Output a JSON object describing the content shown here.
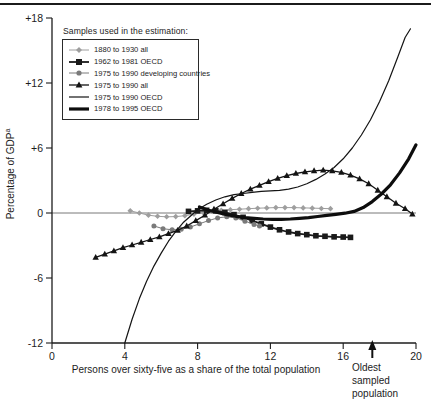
{
  "figure": {
    "background": "#ffffff",
    "rule_color": "#1b1b1b"
  },
  "chart_data": {
    "type": "line",
    "xlabel": "Persons over sixty-five as a share of the total population",
    "ylabel": "Percentage of GDP",
    "ylabel_superscript": "a",
    "xlim": [
      0,
      20
    ],
    "ylim": [
      -12,
      18
    ],
    "grid": false,
    "zero_line": true,
    "x_ticks": [
      {
        "value": 0,
        "label": "0"
      },
      {
        "value": 4,
        "label": "4"
      },
      {
        "value": 8,
        "label": "8"
      },
      {
        "value": 12,
        "label": "12"
      },
      {
        "value": 16,
        "label": "16"
      },
      {
        "value": 20,
        "label": "20"
      }
    ],
    "y_ticks": [
      {
        "value": 18,
        "label": "+18"
      },
      {
        "value": 12,
        "label": "+12"
      },
      {
        "value": 6,
        "label": "+6"
      },
      {
        "value": 0,
        "label": "0"
      },
      {
        "value": -6,
        "label": "-6"
      },
      {
        "value": -12,
        "label": "-12"
      }
    ],
    "legend": {
      "title": "Samples used in the estimation:",
      "position": "top-left"
    },
    "annotation": {
      "lines": [
        "Oldest",
        "sampled",
        "population"
      ],
      "arrow_x": 17.6
    },
    "series": [
      {
        "name": "1880 to 1930 all",
        "marker": "diamond",
        "color": "#9e9e9e",
        "line_width": 1,
        "points": [
          [
            4.3,
            0.2
          ],
          [
            4.8,
            0.0
          ],
          [
            5.3,
            -0.2
          ],
          [
            5.8,
            -0.3
          ],
          [
            6.3,
            -0.35
          ],
          [
            6.8,
            -0.33
          ],
          [
            7.3,
            -0.25
          ],
          [
            7.8,
            -0.1
          ],
          [
            8.3,
            0.05
          ],
          [
            8.8,
            0.15
          ],
          [
            9.3,
            0.25
          ],
          [
            9.8,
            0.3
          ],
          [
            10.3,
            0.35
          ],
          [
            10.8,
            0.4
          ],
          [
            11.3,
            0.44
          ],
          [
            11.8,
            0.47
          ],
          [
            12.3,
            0.5
          ],
          [
            12.8,
            0.5
          ],
          [
            13.3,
            0.5
          ],
          [
            13.8,
            0.47
          ],
          [
            14.3,
            0.45
          ],
          [
            14.8,
            0.42
          ],
          [
            15.3,
            0.4
          ]
        ]
      },
      {
        "name": "1962 to 1981 OECD",
        "marker": "square",
        "color": "#1a1a1a",
        "line_width": 1.8,
        "points": [
          [
            7.5,
            0.15
          ],
          [
            8.0,
            0.2
          ],
          [
            8.5,
            0.25
          ],
          [
            9.0,
            0.2
          ],
          [
            9.5,
            0.05
          ],
          [
            10.0,
            -0.15
          ],
          [
            10.5,
            -0.4
          ],
          [
            11.0,
            -0.7
          ],
          [
            11.5,
            -1.0
          ],
          [
            12.0,
            -1.3
          ],
          [
            12.5,
            -1.55
          ],
          [
            13.0,
            -1.75
          ],
          [
            13.5,
            -1.9
          ],
          [
            14.0,
            -2.0
          ],
          [
            14.5,
            -2.1
          ],
          [
            15.0,
            -2.15
          ],
          [
            15.5,
            -2.2
          ],
          [
            16.0,
            -2.22
          ],
          [
            16.4,
            -2.25
          ]
        ]
      },
      {
        "name": "1975 to 1990 developing countries",
        "marker": "circle",
        "color": "#7a7a7a",
        "line_width": 1,
        "points": [
          [
            5.6,
            -1.2
          ],
          [
            6.1,
            -1.45
          ],
          [
            6.6,
            -1.55
          ],
          [
            7.1,
            -1.5
          ],
          [
            7.6,
            -1.3
          ],
          [
            8.1,
            -1.0
          ],
          [
            8.6,
            -0.7
          ],
          [
            9.1,
            -0.45
          ],
          [
            9.6,
            -0.35
          ],
          [
            10.1,
            -0.45
          ],
          [
            10.6,
            -0.75
          ],
          [
            11.1,
            -1.05
          ],
          [
            11.4,
            -1.2
          ]
        ]
      },
      {
        "name": "1975 to 1990 all",
        "marker": "triangle",
        "color": "#141414",
        "line_width": 1.3,
        "points": [
          [
            2.4,
            -4.1
          ],
          [
            2.9,
            -3.8
          ],
          [
            3.4,
            -3.5
          ],
          [
            3.9,
            -3.2
          ],
          [
            4.4,
            -2.95
          ],
          [
            4.9,
            -2.7
          ],
          [
            5.4,
            -2.45
          ],
          [
            5.9,
            -2.2
          ],
          [
            6.4,
            -1.9
          ],
          [
            6.9,
            -1.6
          ],
          [
            7.4,
            -1.2
          ],
          [
            7.9,
            -0.7
          ],
          [
            8.4,
            -0.2
          ],
          [
            8.9,
            0.35
          ],
          [
            9.4,
            0.85
          ],
          [
            9.9,
            1.35
          ],
          [
            10.4,
            1.8
          ],
          [
            10.9,
            2.2
          ],
          [
            11.4,
            2.55
          ],
          [
            11.9,
            2.9
          ],
          [
            12.4,
            3.2
          ],
          [
            12.9,
            3.45
          ],
          [
            13.4,
            3.65
          ],
          [
            13.9,
            3.8
          ],
          [
            14.4,
            3.9
          ],
          [
            14.9,
            3.95
          ],
          [
            15.4,
            3.9
          ],
          [
            15.9,
            3.75
          ],
          [
            16.4,
            3.5
          ],
          [
            16.9,
            3.15
          ],
          [
            17.4,
            2.7
          ],
          [
            17.9,
            2.1
          ],
          [
            18.4,
            1.5
          ],
          [
            18.9,
            0.9
          ],
          [
            19.4,
            0.4
          ],
          [
            19.8,
            -0.1
          ]
        ]
      },
      {
        "name": "1975 to 1990 OECD",
        "marker": "none",
        "color": "#141414",
        "line_width": 1.2,
        "points": [
          [
            4.0,
            -12.0
          ],
          [
            4.4,
            -9.8
          ],
          [
            4.8,
            -7.9
          ],
          [
            5.2,
            -6.3
          ],
          [
            5.6,
            -4.9
          ],
          [
            6.0,
            -3.7
          ],
          [
            6.4,
            -2.6
          ],
          [
            6.8,
            -1.7
          ],
          [
            7.2,
            -0.9
          ],
          [
            7.6,
            -0.3
          ],
          [
            8.0,
            0.3
          ],
          [
            8.5,
            0.8
          ],
          [
            9.0,
            1.2
          ],
          [
            9.5,
            1.5
          ],
          [
            10.0,
            1.7
          ],
          [
            10.5,
            1.8
          ],
          [
            11.0,
            1.9
          ],
          [
            11.5,
            2.0
          ],
          [
            12.0,
            2.05
          ],
          [
            12.5,
            2.1
          ],
          [
            13.0,
            2.2
          ],
          [
            13.5,
            2.4
          ],
          [
            14.0,
            2.7
          ],
          [
            14.5,
            3.1
          ],
          [
            15.0,
            3.6
          ],
          [
            15.5,
            4.2
          ],
          [
            16.0,
            5.0
          ],
          [
            16.5,
            6.0
          ],
          [
            17.0,
            7.2
          ],
          [
            17.5,
            8.6
          ],
          [
            18.0,
            10.3
          ],
          [
            18.5,
            12.2
          ],
          [
            19.0,
            14.4
          ],
          [
            19.4,
            16.2
          ],
          [
            19.7,
            17.0
          ]
        ]
      },
      {
        "name": "1978 to 1995 OECD",
        "marker": "none",
        "color": "#0d0d0d",
        "line_width": 3.2,
        "points": [
          [
            8.1,
            0.55
          ],
          [
            8.6,
            0.25
          ],
          [
            9.1,
            0.05
          ],
          [
            9.6,
            -0.15
          ],
          [
            10.1,
            -0.3
          ],
          [
            10.6,
            -0.42
          ],
          [
            11.1,
            -0.5
          ],
          [
            11.6,
            -0.55
          ],
          [
            12.1,
            -0.58
          ],
          [
            12.6,
            -0.58
          ],
          [
            13.1,
            -0.55
          ],
          [
            13.6,
            -0.5
          ],
          [
            14.1,
            -0.42
          ],
          [
            14.6,
            -0.32
          ],
          [
            15.1,
            -0.22
          ],
          [
            15.6,
            -0.12
          ],
          [
            16.1,
            -0.02
          ],
          [
            16.6,
            0.15
          ],
          [
            17.1,
            0.5
          ],
          [
            17.6,
            1.05
          ],
          [
            18.1,
            1.75
          ],
          [
            18.6,
            2.6
          ],
          [
            19.1,
            3.7
          ],
          [
            19.6,
            5.0
          ],
          [
            20.0,
            6.3
          ]
        ]
      }
    ]
  }
}
